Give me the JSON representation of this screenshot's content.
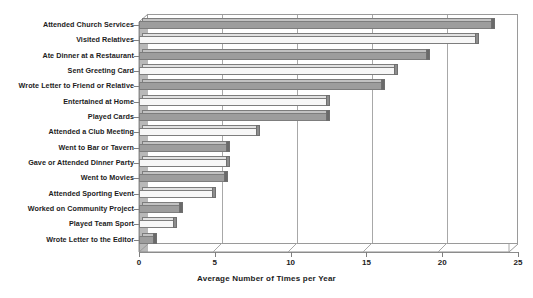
{
  "chart_data": {
    "type": "bar",
    "orientation": "horizontal",
    "title": "",
    "xlabel": "Average Number of Times per Year",
    "ylabel": "",
    "xlim": [
      0,
      25
    ],
    "xticks": [
      0,
      5,
      10,
      15,
      20,
      25
    ],
    "grid": true,
    "legend": false,
    "categories": [
      "Attended Church Services",
      "Visited Relatives",
      "Ate Dinner at a Restaurant",
      "Sent Greeting Card",
      "Wrote Letter to Friend or Relative",
      "Entertained at Home",
      "Played Cards",
      "Attended a Club Meeting",
      "Went to Bar or Tavern",
      "Gave or Attended Dinner Party",
      "Went to Movies",
      "Attended Sporting Event",
      "Worked on Community Project",
      "Played Team Sport",
      "Wrote Letter to the Editor"
    ],
    "values": [
      23.3,
      22.2,
      19.0,
      16.9,
      16.0,
      12.4,
      12.4,
      7.8,
      5.8,
      5.8,
      5.7,
      4.9,
      2.7,
      2.3,
      1.0
    ],
    "style": {
      "bar_color_odd": "#9d9d9d",
      "bar_color_even": "#f7f7f7",
      "bar_outline": "#7d7d7d",
      "gridline_color": "#a8a8a8",
      "frame_color": "#9a9a9a",
      "sidewall_color": "#b9b9b9",
      "background": "#ffffff",
      "effect": "3d-bar"
    }
  },
  "axis": {
    "x_tick_labels": [
      "0",
      "5",
      "10",
      "15",
      "20",
      "25"
    ],
    "x_axis_title": "Average Number of Times per Year"
  }
}
